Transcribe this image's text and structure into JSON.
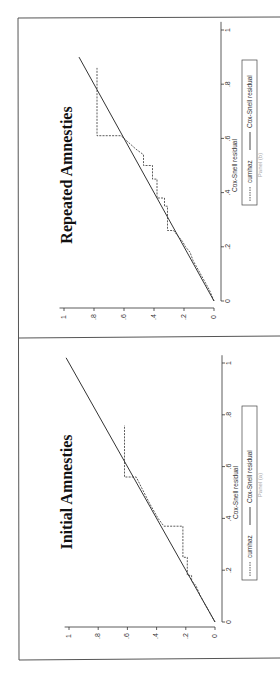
{
  "figure": {
    "orientation": "rotated-90-ccw",
    "frame_color": "#555555",
    "line_color": "#333333"
  },
  "chart_data": [
    {
      "type": "line",
      "title": "Repeated Amnesties",
      "caption": "Panel (b)",
      "xlabel": "Cox-Snell residual",
      "ylabel": "",
      "xlim": [
        0,
        1
      ],
      "ylim": [
        0,
        1
      ],
      "xticks": [
        "0",
        ".2",
        ".4",
        ".6",
        ".8",
        "1"
      ],
      "yticks": [
        "0",
        ".2",
        ".4",
        ".6",
        ".8",
        "1"
      ],
      "grid": false,
      "legend": {
        "position": "bottom",
        "entries": [
          "cumhaz",
          "Cox-Snell residual"
        ]
      },
      "series": [
        {
          "name": "cumhaz",
          "style": "dashed-step",
          "x": [
            0,
            0.04,
            0.08,
            0.1,
            0.13,
            0.15,
            0.18,
            0.2,
            0.22,
            0.24,
            0.26,
            0.26,
            0.35,
            0.35,
            0.38,
            0.38,
            0.45,
            0.45,
            0.5,
            0.5,
            0.54,
            0.56,
            0.61,
            0.61,
            0.86
          ],
          "y": [
            0,
            0.03,
            0.07,
            0.09,
            0.12,
            0.14,
            0.16,
            0.19,
            0.21,
            0.24,
            0.27,
            0.31,
            0.31,
            0.33,
            0.33,
            0.38,
            0.38,
            0.41,
            0.41,
            0.47,
            0.47,
            0.52,
            0.62,
            0.78,
            0.78
          ]
        },
        {
          "name": "Cox-Snell residual",
          "style": "solid",
          "x": [
            0,
            0.9
          ],
          "y": [
            0,
            0.9
          ]
        }
      ]
    },
    {
      "type": "line",
      "title": "Initial Amnesties",
      "caption": "Panel (a)",
      "xlabel": "Cox-Snell residual",
      "ylabel": "",
      "xlim": [
        0,
        1
      ],
      "ylim": [
        0,
        1
      ],
      "xticks": [
        "0",
        ".2",
        ".4",
        ".6",
        ".8",
        "1"
      ],
      "yticks": [
        "0",
        ".2",
        ".4",
        ".6",
        ".8",
        "1"
      ],
      "grid": false,
      "legend": {
        "position": "bottom",
        "entries": [
          "cumhaz",
          "Cox-Snell residual"
        ]
      },
      "series": [
        {
          "name": "cumhaz",
          "style": "dashed-step",
          "x": [
            0,
            0.05,
            0.1,
            0.14,
            0.16,
            0.18,
            0.18,
            0.25,
            0.25,
            0.37,
            0.37,
            0.4,
            0.46,
            0.56,
            0.56,
            0.76
          ],
          "y": [
            0,
            0.05,
            0.1,
            0.13,
            0.16,
            0.16,
            0.19,
            0.19,
            0.22,
            0.22,
            0.35,
            0.39,
            0.45,
            0.54,
            0.62,
            0.62
          ]
        },
        {
          "name": "Cox-Snell residual",
          "style": "solid",
          "x": [
            0,
            1.02
          ],
          "y": [
            0,
            1.02
          ]
        }
      ]
    }
  ]
}
